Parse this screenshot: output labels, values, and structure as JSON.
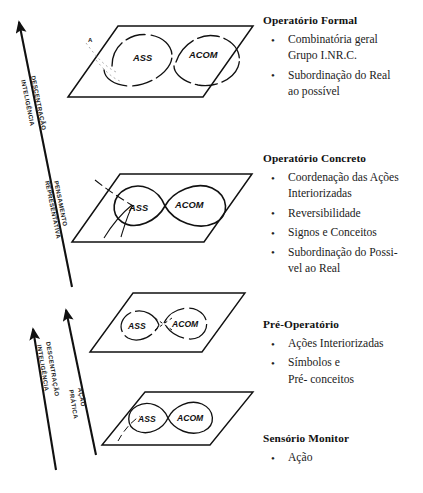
{
  "diagram": {
    "title_semantics": "Piaget stages diagram with assimilation/accommodation lemniscates on planes",
    "plane_label_left": "ASS",
    "plane_label_right": "ACOM",
    "small_vertex_label": "A",
    "planes": [
      {
        "id": "plane-formal",
        "labels": [
          "ASS",
          "ACOM"
        ]
      },
      {
        "id": "plane-concreto",
        "labels": [
          "ASS",
          "ACOM"
        ]
      },
      {
        "id": "plane-preop",
        "labels": [
          "ASS",
          "ACOM"
        ]
      },
      {
        "id": "plane-sensorio",
        "labels": [
          "ASS",
          "ACOM"
        ]
      }
    ],
    "axes": [
      {
        "id": "axis-upper",
        "lines": [
          "DESCENTRAÇÃO",
          "INTELIGÊNCIA"
        ]
      },
      {
        "id": "axis-upper-secondary",
        "lines": [
          "PENSAMENTO",
          "REPRESENTATIVA"
        ]
      },
      {
        "id": "axis-lower",
        "lines": [
          "DESCENTRAÇÃO",
          "INTELIGÊNCIA"
        ]
      },
      {
        "id": "axis-lower-secondary",
        "lines": [
          "AÇÃO",
          "PRÁTICA"
        ]
      }
    ],
    "ink_color": "#111111"
  },
  "sections": [
    {
      "id": "formal",
      "title": "Operatório Formal",
      "bullets": [
        [
          "Combinatória geral",
          "Grupo I.NR.C."
        ],
        [
          "Subordinação do Real",
          "ao possível"
        ]
      ]
    },
    {
      "id": "concreto",
      "title": "Operatório Concreto",
      "bullets": [
        [
          "Coordenação das Ações",
          "Interiorizadas"
        ],
        [
          "Reversibilidade"
        ],
        [
          "Signos e Conceitos"
        ],
        [
          "Subordinação do Possi-",
          "vel ao Real"
        ]
      ]
    },
    {
      "id": "preop",
      "title": "Pré-Operatório",
      "bullets": [
        [
          "Ações Interiorizadas"
        ],
        [
          "Símbolos e",
          "Pré- conceitos"
        ]
      ]
    },
    {
      "id": "sensorio",
      "title": "Sensório Monitor",
      "bullets": [
        [
          "Ação"
        ]
      ]
    }
  ],
  "bullet_glyph": "•"
}
